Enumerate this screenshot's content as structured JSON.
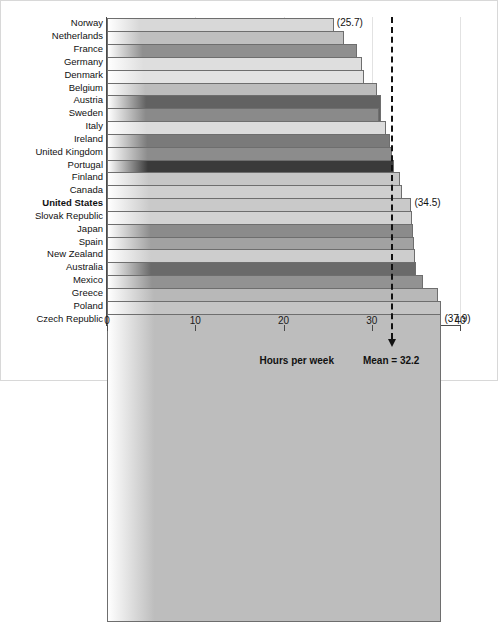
{
  "chart_data": {
    "type": "bar",
    "orientation": "horizontal",
    "title": "",
    "xlabel": "Hours per week",
    "ylabel": "",
    "xlim": [
      0,
      40
    ],
    "xticks": [
      0,
      10,
      20,
      30,
      40
    ],
    "grid": true,
    "legend": null,
    "categories": [
      "Norway",
      "Netherlands",
      "France",
      "Germany",
      "Denmark",
      "Belgium",
      "Austria",
      "Sweden",
      "Italy",
      "Ireland",
      "United Kingdom",
      "Portugal",
      "Finland",
      "Canada",
      "United States",
      "Slovak Republic",
      "Japan",
      "Spain",
      "New Zealand",
      "Australia",
      "Mexico",
      "Greece",
      "Poland",
      "Czech Republic"
    ],
    "values": [
      25.7,
      26.8,
      28.3,
      28.9,
      29.1,
      30.6,
      31.0,
      30.8,
      31.6,
      32.1,
      32.3,
      32.5,
      33.2,
      33.4,
      34.5,
      34.6,
      34.7,
      34.8,
      34.9,
      35.0,
      35.8,
      37.5,
      37.8,
      37.9
    ],
    "bar_shades": [
      "#d8d8d8",
      "#bfbfbf",
      "#8f8f8f",
      "#dedede",
      "#e2e2e2",
      "#bcbcbc",
      "#626262",
      "#8a8a8a",
      "#dcdcdc",
      "#7a7a7a",
      "#8c8c8c",
      "#3a3a3a",
      "#c6c6c6",
      "#cfcfcf",
      "#c9c9c9",
      "#d2d2d2",
      "#8b8b8b",
      "#a2a2a2",
      "#cdcdcd",
      "#6a6a6a",
      "#929292",
      "#b8b8b8",
      "#c4c4c4",
      "#bdbdbd"
    ],
    "value_labels": [
      {
        "category": "Norway",
        "text": "(25.7)"
      },
      {
        "category": "United States",
        "text": "(34.5)"
      },
      {
        "category": "Czech Republic",
        "text": "(37.9)"
      }
    ],
    "bold_categories": [
      "United States"
    ],
    "annotations": [
      {
        "name": "mean-line",
        "value": 32.2,
        "label": "Mean = 32.2",
        "style": "dashed-vertical-with-arrow"
      }
    ]
  },
  "axis": {
    "x_title": "Hours per week",
    "tick_labels": [
      "0",
      "10",
      "20",
      "30",
      "40"
    ]
  },
  "mean": {
    "label": "Mean = 32.2",
    "value": 32.2
  }
}
